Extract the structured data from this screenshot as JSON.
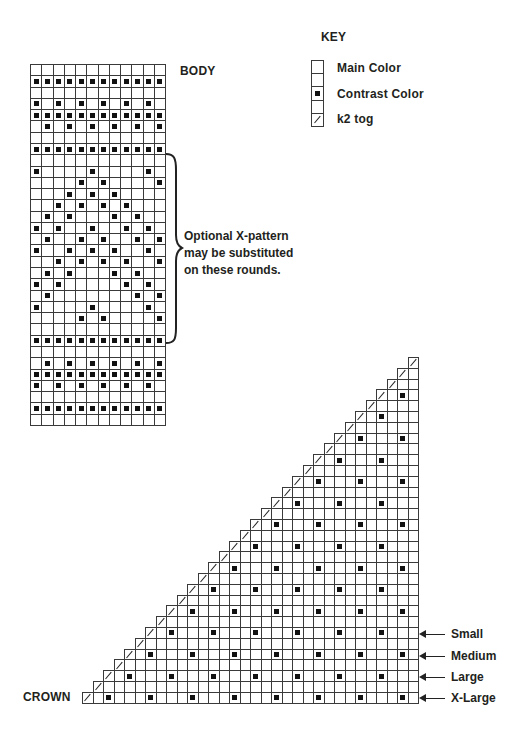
{
  "labels": {
    "key_title": "KEY",
    "body_title": "BODY",
    "crown_title": "CROWN",
    "note_lines": [
      "Optional X-pattern",
      "may be substituted",
      "on these rounds."
    ]
  },
  "key": {
    "items": [
      {
        "symbol": "empty",
        "label": ""
      },
      {
        "symbol": "empty",
        "label": "Main Color"
      },
      {
        "symbol": "square",
        "label": "Contrast Color"
      },
      {
        "symbol": "empty",
        "label": ""
      },
      {
        "symbol": "slash",
        "label": "k2 tog"
      }
    ],
    "main_color_label": "Main Color",
    "contrast_color_label": "Contrast Color",
    "k2tog_label": "k2 tog"
  },
  "body_chart": {
    "columns": 12,
    "rows_top_to_bottom": [
      [],
      [
        0,
        1,
        2,
        3,
        4,
        5,
        6,
        7,
        8,
        9,
        10,
        11
      ],
      [],
      [
        0,
        2,
        4,
        6,
        8,
        10
      ],
      [
        0,
        1,
        2,
        3,
        4,
        5,
        6,
        7,
        8,
        9,
        10,
        11
      ],
      [
        1,
        3,
        5,
        7,
        9,
        11
      ],
      [],
      [
        0,
        1,
        2,
        3,
        4,
        5,
        6,
        7,
        8,
        9,
        10,
        11
      ],
      [],
      [
        0,
        5,
        10
      ],
      [
        4,
        6,
        11
      ],
      [
        3,
        5,
        7
      ],
      [
        2,
        4,
        6,
        8
      ],
      [
        1,
        3,
        7,
        9
      ],
      [
        0,
        2,
        5,
        8,
        10
      ],
      [
        1,
        4,
        6,
        9,
        11
      ],
      [
        0,
        3,
        5,
        7,
        10
      ],
      [
        2,
        4,
        6,
        8,
        11
      ],
      [
        1,
        3,
        7,
        9
      ],
      [
        0,
        2,
        8,
        10
      ],
      [
        1,
        9,
        11
      ],
      [
        0,
        5,
        10
      ],
      [
        4,
        6,
        11
      ],
      [],
      [
        0,
        1,
        2,
        3,
        4,
        5,
        6,
        7,
        8,
        9,
        10,
        11
      ],
      [],
      [
        1,
        3,
        5,
        7,
        9,
        11
      ],
      [
        0,
        1,
        2,
        3,
        4,
        5,
        6,
        7,
        8,
        9,
        10,
        11
      ],
      [
        0,
        2,
        4,
        6,
        8,
        10
      ],
      [],
      [
        0,
        1,
        2,
        3,
        4,
        5,
        6,
        7,
        8,
        9,
        10,
        11
      ],
      []
    ],
    "optional_rows_range": [
      8,
      23
    ]
  },
  "crown_chart": {
    "columns": 32,
    "rows": 32,
    "rule": "row r (from bottom) starts with k2tog slash at col r; even rows have contrast squares at cols r+2, r+6, r+10 ... every 4th stitch",
    "size_markers": [
      {
        "label": "Small",
        "row_from_bottom": 6
      },
      {
        "label": "Medium",
        "row_from_bottom": 4
      },
      {
        "label": "Large",
        "row_from_bottom": 2
      },
      {
        "label": "X-Large",
        "row_from_bottom": 0
      }
    ]
  },
  "colors": {
    "grid_line": "#3a3a3a",
    "contrast": "#111111",
    "text": "#231f20"
  }
}
